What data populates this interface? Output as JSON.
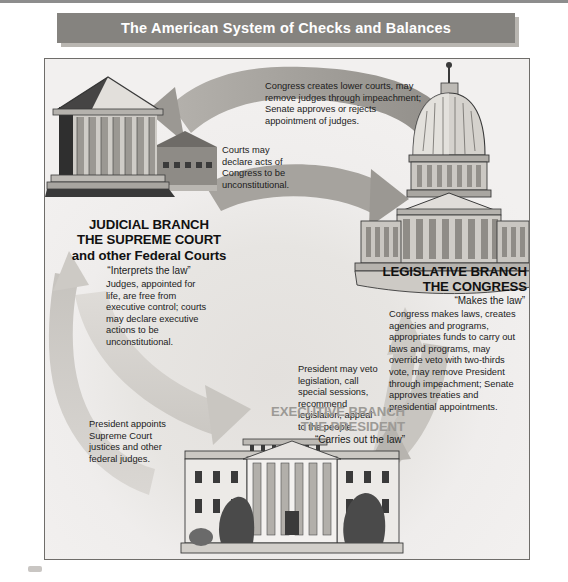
{
  "title": "The American System of Checks and Balances",
  "branches": {
    "judicial": {
      "title": "JUDICIAL BRANCH\nTHE SUPREME COURT\nand other Federal Courts",
      "tagline": "“Interprets the law”",
      "body": "Judges, appointed for life, are free from executive control; courts may declare executive actions to be unconstitutional.",
      "icon": "supreme-court-building-icon"
    },
    "legislative": {
      "title": "LEGISLATIVE BRANCH\nTHE CONGRESS",
      "tagline": "“Makes the law”",
      "body": "Congress makes laws, creates agencies and programs, appropriates funds to carry out laws and programs, may override veto with two-thirds vote, may remove President through impeachment; Senate approves treaties and presidential appointments.",
      "icon": "capitol-building-icon"
    },
    "executive": {
      "title": "EXECUTIVE BRANCH\nTHE PRESIDENT",
      "tagline": "“Carries out the law”",
      "body": "",
      "icon": "white-house-icon"
    }
  },
  "arrows": [
    {
      "id": "congress-to-courts",
      "from": "legislative",
      "to": "judicial",
      "caption": "Congress creates lower courts, may remove judges through impeachment; Senate approves or rejects appointment of judges."
    },
    {
      "id": "courts-to-congress",
      "from": "judicial",
      "to": "legislative",
      "caption": "Courts may declare acts of Congress to be unconstitutional."
    },
    {
      "id": "president-to-congress",
      "from": "executive",
      "to": "legislative",
      "caption": "President may veto legislation, call special sessions, recommend legislation, appeal to the people."
    },
    {
      "id": "president-to-courts",
      "from": "executive",
      "to": "judicial",
      "caption": "President appoints Supreme Court justices and other federal judges."
    }
  ],
  "colors": {
    "banner": "#85837f",
    "banner_shadow": "#b9b6b1",
    "frame_border": "#6f6d6a",
    "panel_background": "#eeeceb",
    "arrow_dark": "#a3a09b",
    "arrow_light": "#d3d0cc",
    "text": "#1b1b1b",
    "executive_title": "#9c9a96",
    "top_rule": "#8d8d8d"
  }
}
